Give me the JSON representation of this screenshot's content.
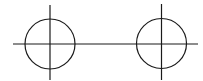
{
  "diagram": {
    "width": 203,
    "height": 81,
    "background": "#ffffff",
    "stroke_color": "#1a1a1a",
    "stroke_width": 1.2,
    "horizontal_line": {
      "x1": 13,
      "y1": 44,
      "x2": 198,
      "y2": 44
    },
    "markers": [
      {
        "name": "left-marker",
        "circle": {
          "cx": 50,
          "cy": 44,
          "r": 25
        },
        "vertical_line": {
          "x1": 50,
          "y1": 5,
          "x2": 50,
          "y2": 80
        }
      },
      {
        "name": "right-marker",
        "circle": {
          "cx": 161.5,
          "cy": 43.5,
          "r": 25
        },
        "vertical_line": {
          "x1": 161.5,
          "y1": 4,
          "x2": 161.5,
          "y2": 80
        }
      }
    ]
  }
}
